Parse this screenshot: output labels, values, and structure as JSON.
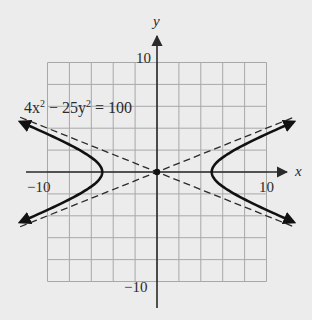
{
  "chart_data": {
    "type": "line",
    "title": "",
    "equation_label": "4x² − 25y² = 100",
    "equation": {
      "coef_x2": "4x",
      "sup1": "2",
      "middle": " − 25y",
      "sup2": "2",
      "rhs": " = 100"
    },
    "xlabel": "x",
    "ylabel": "y",
    "xlim": [
      -10,
      10
    ],
    "ylim": [
      -10,
      10
    ],
    "grid": true,
    "grid_step": 2,
    "tick_labels": {
      "x_neg": "−10",
      "x_pos": "10",
      "y_pos": "10",
      "y_neg": "−10"
    },
    "series": [
      {
        "name": "hyperbola right branch",
        "style": "solid",
        "x": [
          12.5,
          10,
          8,
          7,
          6,
          5.5,
          5,
          5.5,
          6,
          7,
          8,
          10,
          12.5
        ],
        "y": [
          4.58,
          3.46,
          2.5,
          1.96,
          1.33,
          0.92,
          0,
          -0.92,
          -1.33,
          -1.96,
          -2.5,
          -3.46,
          -4.58
        ]
      },
      {
        "name": "hyperbola left branch",
        "style": "solid",
        "x": [
          -12.5,
          -10,
          -8,
          -7,
          -6,
          -5.5,
          -5,
          -5.5,
          -6,
          -7,
          -8,
          -10,
          -12.5
        ],
        "y": [
          4.58,
          3.46,
          2.5,
          1.96,
          1.33,
          0.92,
          0,
          -0.92,
          -1.33,
          -1.96,
          -2.5,
          -3.46,
          -4.58
        ]
      },
      {
        "name": "asymptote y = 2x/5",
        "style": "dashed",
        "x": [
          -12.5,
          12.5
        ],
        "y": [
          -5,
          5
        ]
      },
      {
        "name": "asymptote y = -2x/5",
        "style": "dashed",
        "x": [
          -12.5,
          12.5
        ],
        "y": [
          5,
          -5
        ]
      }
    ],
    "points": [
      {
        "name": "center",
        "x": 0,
        "y": 0
      }
    ],
    "vertices": [
      [
        -5,
        0
      ],
      [
        5,
        0
      ]
    ]
  },
  "colors": {
    "background": "#ececec",
    "grid": "#a8a8a8",
    "axis": "#2a2a2a",
    "curve": "#111111",
    "asymptote": "#2a2a2a"
  }
}
